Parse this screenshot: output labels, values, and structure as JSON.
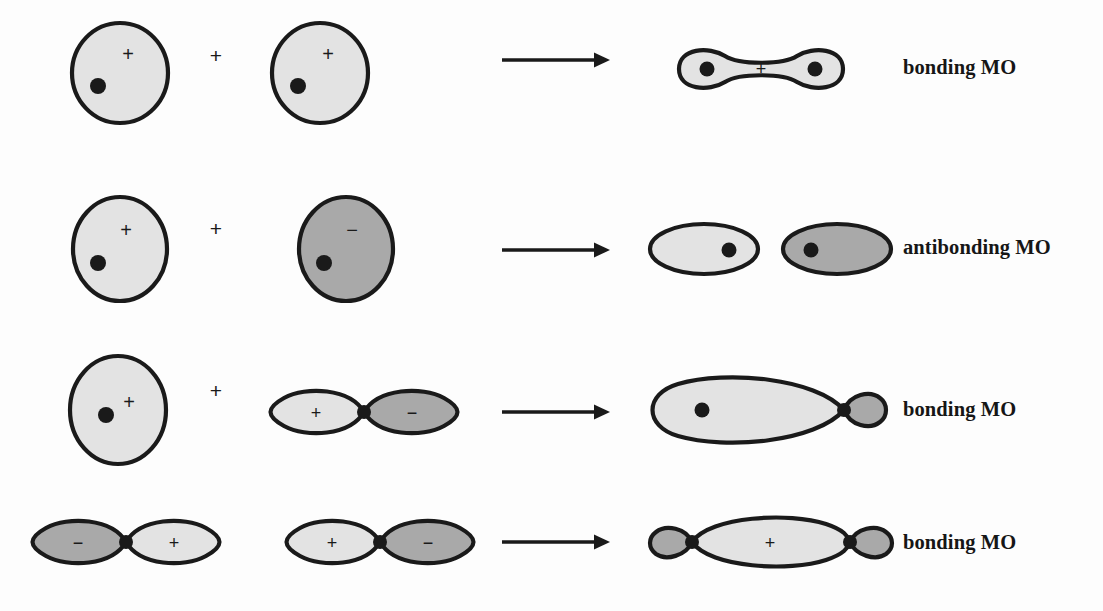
{
  "figure": {
    "background_color": "#fdfdfd",
    "stroke_color": "#1a1a1a",
    "fill_positive": "#e3e3e3",
    "fill_negative": "#a9a9a9",
    "nucleus_color": "#1a1a1a"
  },
  "symbols": {
    "plus": "+",
    "minus": "−",
    "operator_plus": "+",
    "arrow": "⟶"
  },
  "rows": [
    {
      "id": "row-1",
      "label": "bonding MO",
      "operator": "+",
      "reactants": [
        {
          "kind": "s-orbital",
          "shape": "circle",
          "sign": "+",
          "fill": "#e3e3e3",
          "has_nucleus": true
        },
        {
          "kind": "s-orbital",
          "shape": "circle",
          "sign": "+",
          "fill": "#e3e3e3",
          "has_nucleus": true
        }
      ],
      "product": {
        "kind": "sigma-bonding-mo",
        "shape": "peanut",
        "sign": "+",
        "fill": "#e3e3e3",
        "nuclei": 2
      }
    },
    {
      "id": "row-2",
      "label": "antibonding MO",
      "operator": "+",
      "reactants": [
        {
          "kind": "s-orbital",
          "shape": "circle",
          "sign": "+",
          "fill": "#e3e3e3",
          "has_nucleus": true
        },
        {
          "kind": "s-orbital",
          "shape": "circle",
          "sign": "−",
          "fill": "#a9a9a9",
          "has_nucleus": true
        }
      ],
      "product": {
        "kind": "sigma-antibonding-mo",
        "shape": "two-separated-ellipses",
        "lobes": [
          {
            "sign": "",
            "fill": "#e3e3e3",
            "has_nucleus": true
          },
          {
            "sign": "",
            "fill": "#a9a9a9",
            "has_nucleus": true
          }
        ],
        "node": "nodal plane between lobes"
      }
    },
    {
      "id": "row-3",
      "label": "bonding MO",
      "operator": "+",
      "reactants": [
        {
          "kind": "s-orbital",
          "shape": "circle",
          "sign": "+",
          "fill": "#e3e3e3",
          "has_nucleus": true
        },
        {
          "kind": "p-orbital",
          "shape": "dumbbell",
          "lobes": [
            {
              "sign": "+",
              "fill": "#e3e3e3"
            },
            {
              "sign": "−",
              "fill": "#a9a9a9"
            }
          ]
        }
      ],
      "product": {
        "kind": "sp-bonding-mo",
        "shape": "large-lobe-small-lobe",
        "lobes": [
          {
            "sign": "",
            "fill": "#e3e3e3",
            "size": "large",
            "has_nucleus": true
          },
          {
            "sign": "",
            "fill": "#a9a9a9",
            "size": "small"
          }
        ]
      }
    },
    {
      "id": "row-4",
      "label": "bonding MO",
      "operator": "+",
      "reactants": [
        {
          "kind": "p-orbital",
          "shape": "dumbbell",
          "lobes": [
            {
              "sign": "−",
              "fill": "#a9a9a9"
            },
            {
              "sign": "+",
              "fill": "#e3e3e3"
            }
          ]
        },
        {
          "kind": "p-orbital",
          "shape": "dumbbell",
          "lobes": [
            {
              "sign": "+",
              "fill": "#e3e3e3"
            },
            {
              "sign": "−",
              "fill": "#a9a9a9"
            }
          ]
        }
      ],
      "product": {
        "kind": "pi-sigma-bonding-mo",
        "shape": "large-center-lobe-two-small-ends",
        "sign": "+",
        "lobes": [
          {
            "sign": "",
            "fill": "#a9a9a9",
            "size": "small"
          },
          {
            "sign": "+",
            "fill": "#e3e3e3",
            "size": "large"
          },
          {
            "sign": "",
            "fill": "#a9a9a9",
            "size": "small"
          }
        ]
      }
    }
  ]
}
